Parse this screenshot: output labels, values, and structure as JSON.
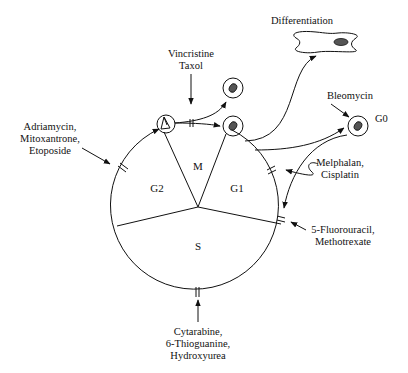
{
  "diagram": {
    "type": "cell-cycle",
    "phases": [
      {
        "id": "M",
        "label": "M"
      },
      {
        "id": "G1",
        "label": "G1"
      },
      {
        "id": "S",
        "label": "S"
      },
      {
        "id": "G2",
        "label": "G2"
      }
    ],
    "states": {
      "g0": "G0",
      "differentiation": "Differentiation"
    },
    "drugs": {
      "vincristine_taxol": [
        "Vincristine",
        "Taxol"
      ],
      "adriamycin": [
        "Adriamycin,",
        "Mitoxantrone,",
        "Etoposide"
      ],
      "bleomycin": [
        "Bleomycin"
      ],
      "melphalan": [
        "Melphalan,",
        "Cisplatin"
      ],
      "fluorouracil": [
        "5-Fluorouracil,",
        "Methotrexate"
      ],
      "cytarabine": [
        "Cytarabine,",
        "6-Thioguanine,",
        "Hydroxyurea"
      ]
    },
    "colors": {
      "line": "#111111",
      "nucleus": "#555555",
      "background": "#ffffff"
    }
  }
}
